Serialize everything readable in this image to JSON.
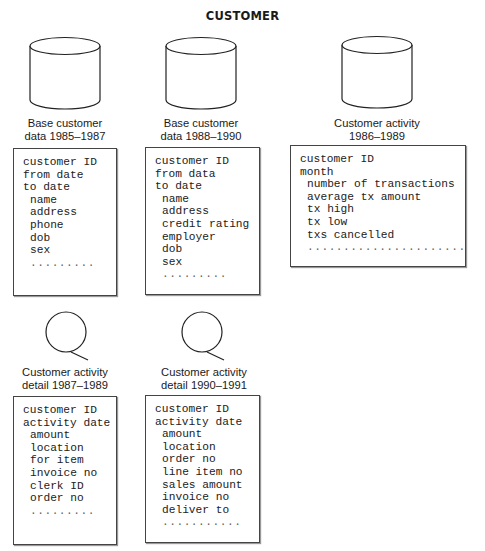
{
  "title": "CUSTOMER",
  "stores": [
    {
      "icon": "database-cylinder-icon",
      "caption": [
        "Base customer",
        "data 1985–1987"
      ],
      "fields": [
        "customer ID",
        "from date",
        "to date"
      ],
      "attributes": [
        "name",
        "address",
        "phone",
        "dob",
        "sex",
        "........."
      ]
    },
    {
      "icon": "database-cylinder-icon",
      "caption": [
        "Base customer",
        "data 1988–1990"
      ],
      "fields": [
        "customer ID",
        "from data",
        "to date"
      ],
      "attributes": [
        "name",
        "address",
        "credit rating",
        "employer",
        "dob",
        "sex",
        "........."
      ]
    },
    {
      "icon": "database-cylinder-icon",
      "caption": [
        "Customer activity",
        "1986–1989"
      ],
      "fields": [
        "customer ID",
        "month"
      ],
      "attributes": [
        "number of transactions",
        "average tx amount",
        "tx high",
        "tx low",
        "txs cancelled",
        "......................"
      ]
    },
    {
      "icon": "magnifier-detail-icon",
      "caption": [
        "Customer activity",
        "detail 1987–1989"
      ],
      "fields": [
        "customer ID",
        "activity date"
      ],
      "attributes": [
        "amount",
        "location",
        "for item",
        "invoice no",
        "clerk ID",
        "order no",
        "........."
      ]
    },
    {
      "icon": "magnifier-detail-icon",
      "caption": [
        "Customer activity",
        "detail 1990–1991"
      ],
      "fields": [
        "customer ID",
        "activity date"
      ],
      "attributes": [
        "amount",
        "location",
        "order no",
        "line item no",
        "sales amount",
        "invoice no",
        "deliver to",
        "..........."
      ]
    }
  ]
}
